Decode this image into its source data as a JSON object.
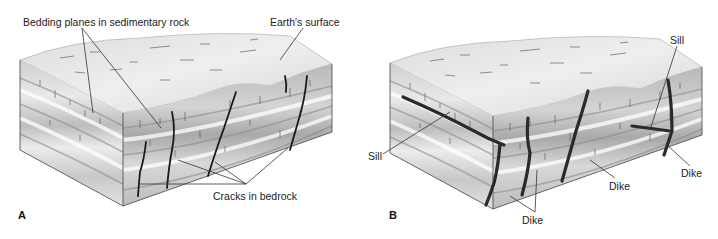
{
  "figure": {
    "panel_a": {
      "letter": "A",
      "labels": {
        "bedding_planes": "Bedding planes in sedimentary rock",
        "earths_surface": "Earth's surface",
        "cracks": "Cracks in bedrock"
      }
    },
    "panel_b": {
      "letter": "B",
      "labels": {
        "sill_left": "Sill",
        "sill_top": "Sill",
        "dike_bottom": "Dike",
        "dike_middle": "Dike",
        "dike_right": "Dike"
      }
    },
    "colors": {
      "background": "#ffffff",
      "rock_light": "#e6e6e6",
      "rock_mid": "#c4c4c4",
      "intrusion": "#2a2a2a",
      "text": "#222222"
    }
  }
}
